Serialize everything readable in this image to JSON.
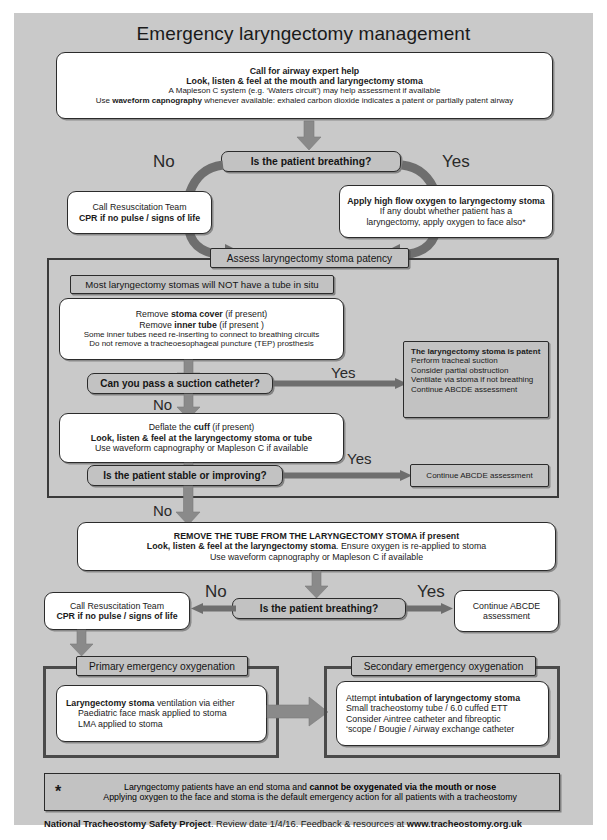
{
  "page": {
    "title": "Emergency laryngectomy management",
    "background": "#c9c9c9",
    "accent": "#6e6e6e",
    "box_fill": "#ffffff",
    "pill_fill": "#c2c2c2"
  },
  "top_box": {
    "line1": "Call for airway expert help",
    "line2": "Look, listen & feel at the mouth and laryngectomy stoma",
    "line3": "A Mapleson C system (e.g. ‘Waters circuit’) may help assessment if available",
    "line4_a": "Use ",
    "line4_b": "waveform capnography",
    "line4_c": " whenever available:  exhaled carbon dioxide indicates a patent or partially patent airway"
  },
  "decision_breathing_top": {
    "label": "Is the patient breathing?",
    "no_label": "No",
    "yes_label": "Yes"
  },
  "resus_box_top": {
    "line1": "Call Resuscitation Team",
    "line2": "CPR if no pulse / signs of life"
  },
  "oxygen_box": {
    "line1": "Apply high flow oxygen to laryngectomy stoma",
    "line2": "If any doubt whether patient has a",
    "line3": "laryngectomy, apply oxygen to face also*"
  },
  "assess_header": {
    "label": "Assess laryngectomy stoma patency"
  },
  "no_tube_note": {
    "label": "Most laryngectomy stomas will NOT have a tube in situ"
  },
  "remove_box": {
    "line1_a": "Remove ",
    "line1_b": "stoma cover",
    "line1_c": " (if present)",
    "line2_a": "Remove ",
    "line2_b": "inner tube",
    "line2_c": " (if present )",
    "line3": "Some inner tubes need re-inserting to connect to breathing circuits",
    "line4": "Do not remove a tracheoesophageal puncture (TEP) prosthesis"
  },
  "decision_suction": {
    "label": "Can you pass a suction catheter?",
    "yes_label": "Yes",
    "no_label": "No"
  },
  "patent_box": {
    "line1": "The laryngectomy stoma is patent",
    "line2": "Perform tracheal suction",
    "line3": "Consider partial obstruction",
    "line4": "Ventilate via stoma if not breathing",
    "line5": "Continue ABCDE assessment"
  },
  "deflate_box": {
    "line1_a": "Deflate the ",
    "line1_b": "cuff",
    "line1_c": " (if present)",
    "line2": "Look, listen & feel at the laryngectomy stoma or tube",
    "line3": "Use waveform capnography or Mapleson C if available"
  },
  "decision_stable": {
    "label": "Is the patient stable or improving?",
    "yes_label": "Yes",
    "no_label": "No"
  },
  "continue_abcde_mid": {
    "label": "Continue ABCDE assessment"
  },
  "remove_tube_box": {
    "line1": "REMOVE THE TUBE FROM THE LARYNGECTOMY STOMA if present",
    "line2_a": "Look, listen & feel at the laryngectomy stoma",
    "line2_b": ". Ensure oxygen is re-applied to stoma",
    "line3": "Use waveform capnography or Mapleson C if available"
  },
  "decision_breathing_bottom": {
    "label": "Is the patient breathing?",
    "no_label": "No",
    "yes_label": "Yes"
  },
  "resus_box_bottom": {
    "line1": "Call Resuscitation Team",
    "line2": "CPR if no pulse / signs of life"
  },
  "continue_abcde_bottom": {
    "line1": "Continue ABCDE",
    "line2": "assessment"
  },
  "primary_oxygenation": {
    "header": "Primary emergency oxygenation",
    "line1_a": "Laryngectomy stoma",
    "line1_b": " ventilation via either",
    "line2": "Paediatric face mask applied to stoma",
    "line3": "LMA applied to stoma"
  },
  "secondary_oxygenation": {
    "header": "Secondary emergency oxygenation",
    "line1_a": "Attempt ",
    "line1_b": "intubation of laryngectomy stoma",
    "line2": "Small tracheostomy tube / 6.0 cuffed ETT",
    "line3": "Consider Aintree catheter and fibreoptic",
    "line4": "‘scope / Bougie / Airway exchange catheter"
  },
  "footnote": {
    "star": "*",
    "line1_a": "Laryngectomy patients have an end stoma and ",
    "line1_b": "cannot be oxygenated via the mouth or nose",
    "line2": "Applying oxygen to the face and stoma is the default emergency action for all patients with a tracheostomy"
  },
  "credit": {
    "org": "National Tracheostomy Safety Project",
    "mid": ". Review date 1/4/16. Feedback & resources at ",
    "url": "www.tracheostomy.org.uk"
  }
}
